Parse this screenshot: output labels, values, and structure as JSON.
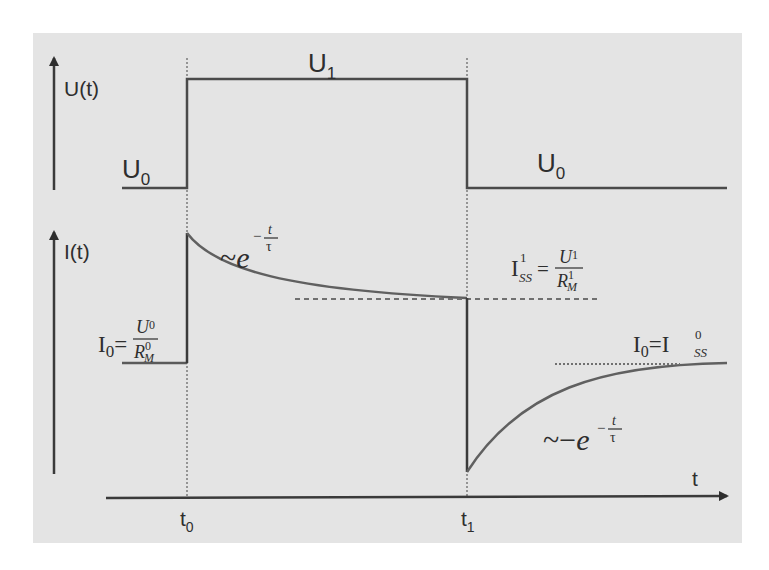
{
  "colors": {
    "background": "#ffffff",
    "panel": "#e4e4e4",
    "axis": "#3a3a3a",
    "signal": "#4a4a4a",
    "curve": "#606060",
    "dashed": "#707070"
  },
  "upper_plot": {
    "axis_label": "U(t)",
    "levels": {
      "low_left_label": "U",
      "low_left_sub": "0",
      "high_label": "U",
      "high_sub": "1",
      "low_right_label": "U",
      "low_right_sub": "0"
    }
  },
  "lower_plot": {
    "axis_label": "I(t)",
    "initial": {
      "lhs": "I",
      "lhs_sub": "0",
      "eq": "=",
      "num": "U",
      "num_sub": "0",
      "den": "R",
      "den_sup": "0",
      "den_sub": "M"
    },
    "decay_label": {
      "prefix": "~",
      "base": "e",
      "exp_sign": "−",
      "exp_num": "t",
      "exp_den": "τ"
    },
    "steady_state_1": {
      "lhs": "I",
      "lhs_sup": "1",
      "lhs_sub": "SS",
      "eq": "=",
      "num": "U",
      "num_sub": "1",
      "den": "R",
      "den_sup": "1",
      "den_sub": "M"
    },
    "steady_state_0": {
      "lhs": "I",
      "lhs_sub": "0",
      "eq": "=",
      "rhs": "I",
      "rhs_sup": "0",
      "rhs_sub": "SS"
    },
    "recovery_label": {
      "prefix": "~−",
      "base": "e",
      "exp_sign": "−",
      "exp_num": "t",
      "exp_den": "τ"
    }
  },
  "time_axis": {
    "label": "t",
    "ticks": [
      {
        "label": "t",
        "sub": "0"
      },
      {
        "label": "t",
        "sub": "1"
      }
    ]
  }
}
